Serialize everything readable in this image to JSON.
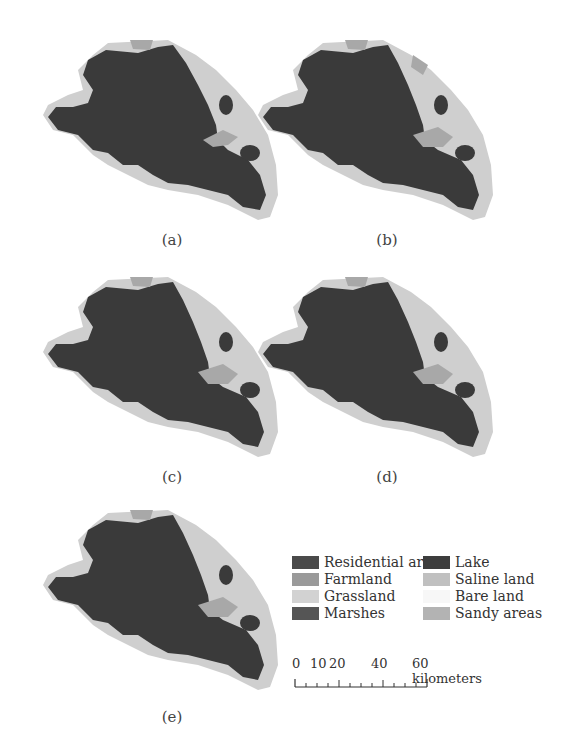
{
  "figure": {
    "panels": [
      {
        "id": "a",
        "label": "(a)"
      },
      {
        "id": "b",
        "label": "(b)"
      },
      {
        "id": "c",
        "label": "(c)"
      },
      {
        "id": "d",
        "label": "(d)"
      },
      {
        "id": "e",
        "label": "(e)"
      }
    ],
    "legend": {
      "items": [
        {
          "label": "Residential area",
          "color": "#4a4a4a"
        },
        {
          "label": "Farmland",
          "color": "#9a9a9a"
        },
        {
          "label": "Grassland",
          "color": "#d2d2d2"
        },
        {
          "label": "Marshes",
          "color": "#555555"
        },
        {
          "label": "Lake",
          "color": "#3d3d3d"
        },
        {
          "label": "Saline land",
          "color": "#c0c0c0"
        },
        {
          "label": "Bare land",
          "color": "#f7f7f7"
        },
        {
          "label": "Sandy areas",
          "color": "#b3b3b3"
        }
      ]
    },
    "scale_bar": {
      "ticks": [
        "0",
        "10",
        "20",
        "40",
        "60"
      ],
      "unit": "kilometers",
      "unit_label": "60 kilometers"
    },
    "colors": {
      "lake": "#3a3a3a",
      "land_light": "#cfcfcf",
      "land_mid": "#a8a8a8",
      "background": "#ffffff"
    }
  }
}
